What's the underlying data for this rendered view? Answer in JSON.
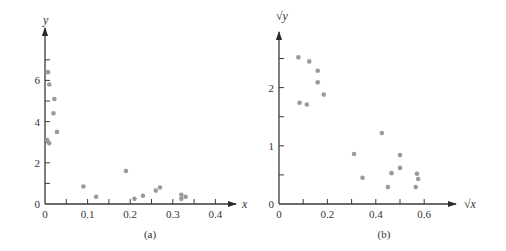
{
  "chart_data": [
    {
      "type": "scatter",
      "panel": "a",
      "caption": "(a)",
      "title": "",
      "xlabel": "x",
      "ylabel": "y",
      "xlim": [
        0,
        0.45
      ],
      "ylim": [
        0,
        7.5
      ],
      "xticks": [
        0,
        0.05,
        0.1,
        0.15,
        0.2,
        0.25,
        0.3,
        0.35,
        0.4
      ],
      "xtick_labels": {
        "0": "0",
        "0.1": "0.1",
        "0.2": "0.2",
        "0.3": "0.3",
        "0.4": "0.4"
      },
      "yticks": [
        0,
        1,
        2,
        3,
        4,
        5,
        6,
        7
      ],
      "ytick_labels": {
        "0": "0",
        "2": "2",
        "4": "4",
        "6": "6"
      },
      "grid": false,
      "legend": null,
      "x": [
        0.007,
        0.01,
        0.022,
        0.02,
        0.028,
        0.005,
        0.01,
        0.09,
        0.12,
        0.19,
        0.21,
        0.23,
        0.26,
        0.27,
        0.32,
        0.32,
        0.33
      ],
      "y": [
        6.4,
        5.8,
        5.1,
        4.4,
        3.5,
        3.1,
        2.95,
        0.85,
        0.35,
        1.6,
        0.25,
        0.4,
        0.65,
        0.8,
        0.45,
        0.25,
        0.35
      ]
    },
    {
      "type": "scatter",
      "panel": "b",
      "caption": "(b)",
      "title": "",
      "xlabel": "√x",
      "ylabel": "√y",
      "xlim": [
        0,
        0.72
      ],
      "ylim": [
        0,
        2.95
      ],
      "xticks": [
        0,
        0.1,
        0.2,
        0.3,
        0.4,
        0.5,
        0.6
      ],
      "xtick_labels": {
        "0": "0",
        "0.2": "0.2",
        "0.4": "0.4",
        "0.6": "0.6"
      },
      "yticks": [
        0,
        0.5,
        1,
        1.5,
        2,
        2.5
      ],
      "ytick_labels": {
        "0": "0",
        "1": "1",
        "2": "2"
      },
      "grid": false,
      "legend": null,
      "x": [
        0.08,
        0.125,
        0.16,
        0.16,
        0.185,
        0.085,
        0.115,
        0.425,
        0.31,
        0.5,
        0.5,
        0.345,
        0.465,
        0.57,
        0.575,
        0.45,
        0.565
      ],
      "y": [
        2.52,
        2.45,
        2.29,
        2.09,
        1.88,
        1.74,
        1.71,
        1.22,
        0.86,
        0.84,
        0.62,
        0.45,
        0.53,
        0.52,
        0.43,
        0.29,
        0.29
      ]
    }
  ],
  "layout": {
    "panels": [
      {
        "ox": 45,
        "oy": 204,
        "px_per_x": 426,
        "px_per_y": 20.6,
        "x_end": 236,
        "y_top": 28,
        "xlabel_pos": [
          242,
          208
        ],
        "ylabel_pos": [
          43,
          24
        ],
        "caption_pos": [
          150,
          238
        ]
      },
      {
        "ox": 279,
        "oy": 204,
        "px_per_x": 242,
        "px_per_y": 58.2,
        "x_end": 456,
        "y_top": 32,
        "xlabel_pos": [
          464,
          208
        ],
        "ylabel_pos": [
          276,
          20
        ],
        "caption_pos": [
          384,
          238
        ]
      }
    ],
    "point_color": "#9a9a9a",
    "axis_color": "#3a3a3a"
  }
}
